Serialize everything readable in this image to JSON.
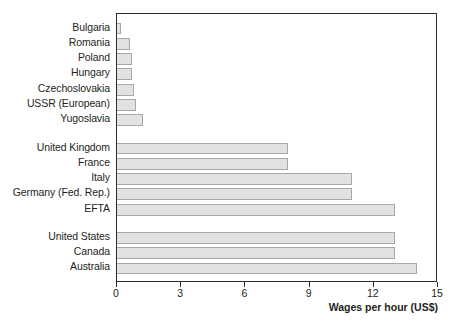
{
  "chart_data": {
    "type": "bar",
    "orientation": "horizontal",
    "title": "",
    "xlabel": "Wages per hour (US$)",
    "ylabel": "",
    "xlim": [
      0,
      15
    ],
    "xticks": [
      0,
      3,
      6,
      9,
      12,
      15
    ],
    "xtick_labels": [
      "0",
      "3",
      "6",
      "9",
      "12",
      "15"
    ],
    "grid": false,
    "legend": null,
    "bar_fill_color": "#e2e2e2",
    "bar_border_color": "#a8a8a8",
    "axis_color": "#2b2b2b",
    "text_color": "#231f20",
    "groups": [
      {
        "name": "eastern-europe",
        "categories": [
          "Bulgaria",
          "Romania",
          "Poland",
          "Hungary",
          "Czechoslovakia",
          "USSR (European)",
          "Yugoslavia"
        ],
        "values": [
          0.2,
          0.6,
          0.7,
          0.7,
          0.8,
          0.9,
          1.2
        ]
      },
      {
        "name": "western-europe",
        "categories": [
          "United Kingdom",
          "France",
          "Italy",
          "Germany (Fed. Rep.)",
          "EFTA"
        ],
        "values": [
          8.0,
          8.0,
          11.0,
          11.0,
          13.0
        ]
      },
      {
        "name": "non-europe",
        "categories": [
          "United States",
          "Canada",
          "Australia"
        ],
        "values": [
          13.0,
          13.0,
          14.0
        ]
      }
    ],
    "categories": [
      "Bulgaria",
      "Romania",
      "Poland",
      "Hungary",
      "Czechoslovakia",
      "USSR (European)",
      "Yugoslavia",
      "United Kingdom",
      "France",
      "Italy",
      "Germany (Fed. Rep.)",
      "EFTA",
      "United States",
      "Canada",
      "Australia"
    ],
    "values": [
      0.2,
      0.6,
      0.7,
      0.7,
      0.8,
      0.9,
      1.2,
      8.0,
      8.0,
      11.0,
      11.0,
      13.0,
      13.0,
      13.0,
      14.0
    ]
  }
}
